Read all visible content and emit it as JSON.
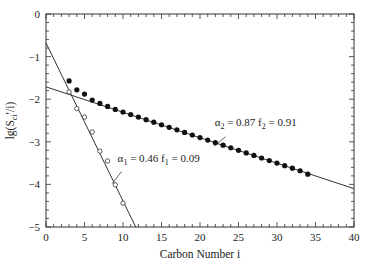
{
  "chart_data": {
    "type": "scatter",
    "title": "",
    "xlabel": "Carbon Number i",
    "ylabel": "lg(S_ci'/i)",
    "ylabel_parts": {
      "main": "lg(S",
      "sub": "ci",
      "tail": "′/i)"
    },
    "xlim": [
      0,
      40
    ],
    "ylim": [
      -5,
      0
    ],
    "xticks": [
      0,
      5,
      10,
      15,
      20,
      25,
      30,
      35,
      40
    ],
    "yticks": [
      0,
      -1,
      -2,
      -3,
      -4,
      -5
    ],
    "grid": false,
    "legend": null,
    "series": [
      {
        "name": "filled (measured)",
        "marker": "filled-circle",
        "x": [
          3,
          4,
          5,
          6,
          7,
          8,
          9,
          10,
          11,
          12,
          13,
          14,
          15,
          16,
          17,
          18,
          19,
          20,
          21,
          22,
          23,
          24,
          25,
          26,
          27,
          28,
          29,
          30,
          31,
          32,
          33,
          34
        ],
        "y": [
          -1.57,
          -1.78,
          -1.88,
          -2.02,
          -2.1,
          -2.17,
          -2.24,
          -2.3,
          -2.36,
          -2.42,
          -2.48,
          -2.54,
          -2.6,
          -2.66,
          -2.72,
          -2.78,
          -2.84,
          -2.9,
          -2.96,
          -3.02,
          -3.08,
          -3.14,
          -3.2,
          -3.26,
          -3.32,
          -3.38,
          -3.44,
          -3.5,
          -3.56,
          -3.62,
          -3.68,
          -3.76
        ]
      },
      {
        "name": "open (component 1)",
        "marker": "open-circle",
        "x": [
          3,
          4,
          5,
          6,
          7,
          8,
          9,
          10
        ],
        "y": [
          -1.83,
          -2.22,
          -2.42,
          -2.77,
          -3.22,
          -3.45,
          -4.01,
          -4.44
        ]
      }
    ],
    "lines": [
      {
        "name": "alpha1 fit",
        "x": [
          0,
          11.65
        ],
        "y": [
          -0.68,
          -5.0
        ]
      },
      {
        "name": "alpha2 fit",
        "x": [
          0,
          40
        ],
        "y": [
          -1.71,
          -4.1
        ]
      }
    ],
    "annotations": [
      {
        "text_alpha": "α",
        "sub_alpha": "1",
        "text_mid": " = 0.46  f",
        "sub_f": "1",
        "text_end": " = 0.09",
        "x": 9.3,
        "y": -3.48,
        "leader": [
          [
            9.8,
            -3.7
          ],
          [
            8.6,
            -3.98
          ]
        ]
      },
      {
        "text_alpha": "α",
        "sub_alpha": "2",
        "text_mid": " = 0.87  f",
        "sub_f": "2",
        "text_end": " = 0.91",
        "x": 21.9,
        "y": -2.62,
        "leader": [
          [
            23.3,
            -2.88
          ],
          [
            21.9,
            -3.1
          ]
        ]
      }
    ]
  }
}
